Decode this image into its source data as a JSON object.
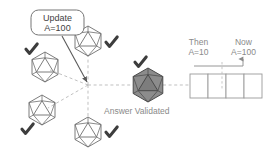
{
  "diagram": {
    "background": "#ffffff",
    "colors": {
      "node_stroke": "#6e6e6e",
      "node_fill": "#ffffff",
      "validated_fill": "#8c8c8c",
      "validated_stroke": "#4a4a4a",
      "check_color": "#3d3d3d",
      "dashed_line": "#b5b5b5",
      "solid_arrow": "#5a5a5a",
      "text_gray": "#8a8a8a",
      "text_dark": "#3f3f3f",
      "box_stroke": "#9a9a9a"
    },
    "callout": {
      "line1": "Update",
      "line2": "A=100"
    },
    "nodes": [
      {
        "id": "node-upper-left",
        "label": "icosahedron-node",
        "validated": true
      },
      {
        "id": "node-top-center",
        "label": "icosahedron-node",
        "validated": true
      },
      {
        "id": "node-lower-left",
        "label": "icosahedron-node",
        "validated": true
      },
      {
        "id": "node-bottom-center",
        "label": "icosahedron-node",
        "validated": true
      },
      {
        "id": "node-validated",
        "label": "icosahedron-node-validated",
        "validated": true
      }
    ],
    "validated_caption": "Answer Validated",
    "timeline": {
      "then": {
        "title": "Then",
        "value": "A=10"
      },
      "now": {
        "title": "Now",
        "value": "A=100"
      },
      "cells": [
        "",
        "",
        "",
        ""
      ]
    }
  }
}
